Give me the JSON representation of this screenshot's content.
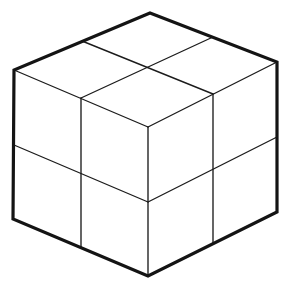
{
  "figure": {
    "grid_divisions": "2x2",
    "visible_faces": 3,
    "visible_cells_total": 12,
    "background_color": "#ffffff",
    "outline_color": "#141414",
    "division_color": "#1c1c1c",
    "fill_color": "#ffffff",
    "outline_stroke_width": 3.2,
    "division_stroke_width": 1.35,
    "canvas": {
      "width": 289,
      "height": 289
    }
  },
  "geometry": {
    "vertices": {
      "top_back_apex": {
        "x": 150,
        "y": 13,
        "label": "top-back-apex"
      },
      "left_corner": {
        "x": 14,
        "y": 70,
        "label": "left-corner"
      },
      "right_corner": {
        "x": 277,
        "y": 62,
        "label": "right-corner"
      },
      "front_center": {
        "x": 148,
        "y": 127,
        "label": "front-center-vertex"
      },
      "bottom_left": {
        "x": 13,
        "y": 219,
        "label": "bottom-left-corner"
      },
      "bottom_right": {
        "x": 277,
        "y": 212,
        "label": "bottom-right-corner"
      },
      "bottom_front": {
        "x": 148,
        "y": 276,
        "label": "bottom-front-vertex"
      }
    },
    "outline_polygon": "150,13 277,62 277,212 148,276 13,219 14,70",
    "faces": [
      {
        "name": "top-face",
        "polygon": "150,13 277,62 148,127 14,70",
        "cells": 4
      },
      {
        "name": "left-face",
        "polygon": "14,70 148,127 148,276 13,219",
        "cells": 4
      },
      {
        "name": "right-face",
        "polygon": "148,127 277,62 277,212 148,276",
        "cells": 4
      }
    ],
    "division_lines": [
      {
        "name": "top-face-division-a",
        "from": {
          "x": 82,
          "y": 41
        },
        "to": {
          "x": 213,
          "y": 94
        },
        "face": "top-face"
      },
      {
        "name": "top-face-division-b",
        "from": {
          "x": 213,
          "y": 37
        },
        "to": {
          "x": 81,
          "y": 98
        },
        "face": "top-face"
      },
      {
        "name": "left-face-vertical-division",
        "from": {
          "x": 81,
          "y": 98
        },
        "to": {
          "x": 81,
          "y": 248
        },
        "face": "left-face"
      },
      {
        "name": "left-face-horizontal-division",
        "from": {
          "x": 14,
          "y": 145
        },
        "to": {
          "x": 148,
          "y": 202
        },
        "face": "left-face"
      },
      {
        "name": "right-face-vertical-division",
        "from": {
          "x": 213,
          "y": 94
        },
        "to": {
          "x": 213,
          "y": 244
        },
        "face": "right-face"
      },
      {
        "name": "right-face-horizontal-division",
        "from": {
          "x": 148,
          "y": 202
        },
        "to": {
          "x": 277,
          "y": 137
        },
        "face": "right-face"
      }
    ]
  }
}
